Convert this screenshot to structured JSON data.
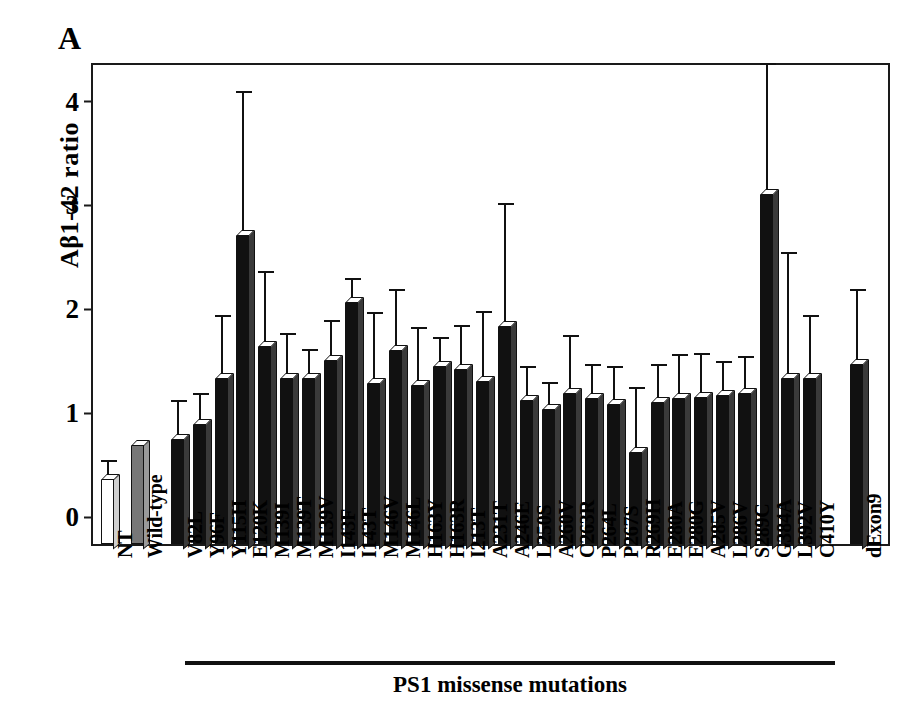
{
  "panel": {
    "letter": "A"
  },
  "chart_data": {
    "type": "bar",
    "title": "",
    "xlabel": "PS1 missense mutations",
    "ylabel": "Aβ1-42 ratio",
    "ylim": [
      0,
      4.65
    ],
    "yticks": [
      "0",
      "1",
      "2",
      "3",
      "4"
    ],
    "ytick_values": [
      0,
      1,
      2,
      3,
      4
    ],
    "grid": false,
    "legend": "none",
    "categories": [
      "NT",
      "Wild-type",
      "V82L",
      "Y96F",
      "Y115H",
      "E120K",
      "M139I",
      "M139T",
      "M139V",
      "I143F",
      "I143T",
      "M146V",
      "M146L",
      "H163Y",
      "H163R",
      "I213T",
      "A231T",
      "A246E",
      "L250S",
      "A260V",
      "C263R",
      "P264L",
      "P267S",
      "R269H",
      "E280A",
      "E280G",
      "A285V",
      "L286V",
      "S289C",
      "G384A",
      "L392V",
      "C410Y",
      "dExon9"
    ],
    "values": [
      0.67,
      1.0,
      1.06,
      1.2,
      1.65,
      3.02,
      1.95,
      1.65,
      1.65,
      1.82,
      2.38,
      1.6,
      1.92,
      1.58,
      1.76,
      1.73,
      1.62,
      2.15,
      1.43,
      1.35,
      1.5,
      1.45,
      1.4,
      0.93,
      1.42,
      1.45,
      1.46,
      1.48,
      1.5,
      3.42,
      1.65,
      1.65,
      1.78
    ],
    "errors_upper": [
      0.8,
      1.0,
      1.38,
      1.44,
      2.2,
      4.35,
      2.62,
      2.02,
      1.87,
      2.15,
      2.55,
      2.22,
      2.45,
      2.08,
      1.98,
      2.1,
      2.23,
      3.27,
      1.7,
      1.55,
      2.0,
      1.72,
      1.7,
      1.5,
      1.72,
      1.82,
      1.83,
      1.75,
      1.8,
      4.62,
      2.8,
      2.2,
      2.45
    ],
    "bar_styles": [
      "white",
      "gray",
      "black",
      "black",
      "black",
      "black",
      "black",
      "black",
      "black",
      "black",
      "black",
      "black",
      "black",
      "black",
      "black",
      "black",
      "black",
      "black",
      "black",
      "black",
      "black",
      "black",
      "black",
      "black",
      "black",
      "black",
      "black",
      "black",
      "black",
      "black",
      "black",
      "black",
      "black"
    ],
    "group_bracket_label": "PS1 missense mutations",
    "group_bracket_range": [
      "V82L",
      "C410Y"
    ]
  }
}
